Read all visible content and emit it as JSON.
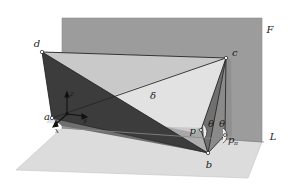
{
  "figure": {
    "background_color": "#ffffff",
    "labels": {
      "point_a": "a",
      "point_b": "b",
      "point_c": "c",
      "point_d": "d",
      "point_p": "p",
      "point_p_pi": "p",
      "point_p_pi_sub": "π",
      "plane_F": "F",
      "line_L": "L",
      "wedge_delta": "δ",
      "angle_theta_left": "θ",
      "angle_theta_right": "θ",
      "axis_x": "x",
      "axis_y": "y",
      "axis_z": "z"
    },
    "colors": {
      "plane_F_fill": "#9a9a9a",
      "plane_F_edge": "#8a8a8a",
      "ground_fill": "#d9d9d9",
      "ground_edge": "#c2c2c2",
      "triangle_dark": "#3b3b3b",
      "triangle_mid_dark": "#6e6e6e",
      "triangle_mid": "#8f8f8f",
      "triangle_light": "#b9b9b9",
      "wedge_highlight": "#e6e6e6",
      "edge_line": "#2b2b2b",
      "vertex_fill": "#ffffff",
      "vertex_stroke": "#1a1a1a",
      "label_color": "#1a1a1a",
      "axis_color": "#111111"
    },
    "geometry": {
      "points": {
        "a": [
          52,
          118
        ],
        "b": [
          208,
          153
        ],
        "c": [
          226,
          58
        ],
        "d": [
          42,
          52
        ],
        "p": [
          201,
          130
        ],
        "p_pi": [
          225,
          135
        ]
      },
      "plane_F_quad": [
        [
          62,
          18
        ],
        [
          262,
          18
        ],
        [
          262,
          142
        ],
        [
          62,
          128
        ]
      ],
      "ground_quad": [
        [
          16,
          170
        ],
        [
          62,
          128
        ],
        [
          262,
          142
        ],
        [
          248,
          178
        ]
      ],
      "line_L_endpoints": [
        [
          62,
          128
        ],
        [
          262,
          142
        ]
      ]
    },
    "counts": {
      "labeled_points": 6,
      "angle_marks": 2,
      "planes": 2
    }
  }
}
